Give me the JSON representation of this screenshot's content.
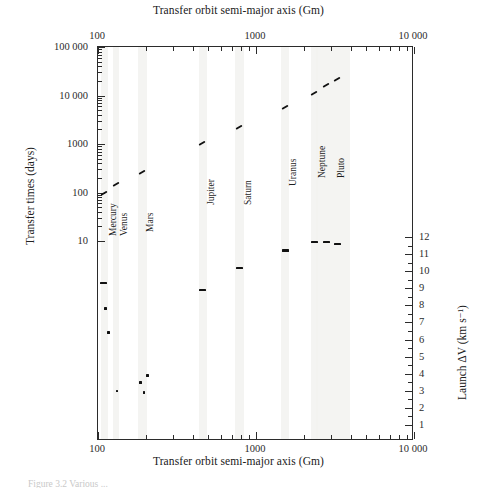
{
  "figure": {
    "top_axis_title": "Transfer orbit semi-major axis (Gm)",
    "bottom_axis_title": "Transfer orbit semi-major axis (Gm)",
    "left_axis_title": "Transfer times (days)",
    "right_axis_title": "Launch ΔV (km s⁻¹)",
    "caption": "Figure 3.2  Various ..."
  },
  "x_labels": {
    "a": "100",
    "b": "1000",
    "c": "10 000"
  },
  "y_left_labels": {
    "l5": "100 000",
    "l4": "10 000",
    "l3": "1000",
    "l2": "100",
    "l1": "10"
  },
  "y_right_labels": {
    "v12": "12",
    "v11": "11",
    "v10": "10",
    "v9": "9",
    "v8": "8",
    "v7": "7",
    "v6": "6",
    "v5": "5",
    "v4": "4",
    "v3": "3",
    "v2": "2",
    "v1": "1"
  },
  "planets": {
    "mercury": "Mercury",
    "venus": "Venus",
    "mars": "Mars",
    "jupiter": "Jupiter",
    "saturn": "Saturn",
    "uranus": "Uranus",
    "neptune": "Neptune",
    "pluto": "Pluto"
  },
  "chart_data": {
    "type": "scatter",
    "title": "",
    "xlabel": "Transfer orbit semi-major axis (Gm)",
    "ylabel": "Transfer times (days)",
    "ylabel_right": "Launch ΔV (km s⁻¹)",
    "xscale": "log",
    "yscale_left": "log",
    "yscale_right": "linear",
    "xlim": [
      100,
      10000
    ],
    "ylim_left": [
      10,
      100000
    ],
    "ylim_right": [
      1,
      12
    ],
    "xticks": [
      100,
      1000,
      10000
    ],
    "yticks_left": [
      10,
      100,
      1000,
      10000,
      100000
    ],
    "yticks_right": [
      1,
      2,
      3,
      4,
      5,
      6,
      7,
      8,
      9,
      10,
      11,
      12
    ],
    "grid": false,
    "legend": "none",
    "planet_axis_positions_gm": {
      "Mercury": 110,
      "Venus": 130,
      "Mars": 190,
      "Jupiter": 460,
      "Saturn": 790,
      "Uranus": 1530,
      "Neptune": 2330,
      "Pluto": 3050
    },
    "series": [
      {
        "name": "Transfer time",
        "unit": "days",
        "axis": "left",
        "points": [
          {
            "planet": "Mercury",
            "x_gm": 110,
            "y_days": 95
          },
          {
            "planet": "Venus",
            "x_gm": 130,
            "y_days": 145
          },
          {
            "planet": "Mars",
            "x_gm": 190,
            "y_days": 255
          },
          {
            "planet": "Jupiter",
            "x_gm": 460,
            "y_days": 1000
          },
          {
            "planet": "Saturn",
            "x_gm": 790,
            "y_days": 2150
          },
          {
            "planet": "Uranus",
            "x_gm": 1530,
            "y_days": 5500
          },
          {
            "planet": "Neptune",
            "x_gm": 2330,
            "y_days": 10500
          },
          {
            "planet": "Pluto",
            "x_gm": 2780,
            "y_days": 15500
          },
          {
            "planet": "Pluto",
            "x_gm": 3300,
            "y_days": 21000
          }
        ]
      },
      {
        "name": "Launch delta-V",
        "unit": "km/s",
        "axis": "right",
        "points": [
          {
            "planet": "Mercury",
            "x_gm": 108,
            "dv_kms": 9.3
          },
          {
            "planet": "Mercury",
            "x_gm": 112,
            "dv_kms": 7.8
          },
          {
            "planet": "Mercury",
            "x_gm": 117,
            "dv_kms": 6.4
          },
          {
            "planet": "Venus",
            "x_gm": 132,
            "dv_kms": 3.0
          },
          {
            "planet": "Mars",
            "x_gm": 186,
            "dv_kms": 3.5
          },
          {
            "planet": "Mars",
            "x_gm": 196,
            "dv_kms": 2.9
          },
          {
            "planet": "Mars",
            "x_gm": 205,
            "dv_kms": 3.9
          },
          {
            "planet": "Jupiter",
            "x_gm": 460,
            "dv_kms": 8.9
          },
          {
            "planet": "Saturn",
            "x_gm": 790,
            "dv_kms": 10.2
          },
          {
            "planet": "Uranus",
            "x_gm": 1530,
            "dv_kms": 11.2
          },
          {
            "planet": "Neptune",
            "x_gm": 2330,
            "dv_kms": 11.7
          },
          {
            "planet": "Pluto",
            "x_gm": 2780,
            "dv_kms": 11.7
          },
          {
            "planet": "Pluto",
            "x_gm": 3300,
            "dv_kms": 11.6
          }
        ]
      }
    ]
  }
}
